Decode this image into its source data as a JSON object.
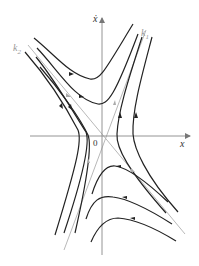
{
  "diagram": {
    "type": "phase-portrait-saddle",
    "axes": {
      "horizontal_label": "x",
      "vertical_label": "ẋ",
      "origin_label": "0"
    },
    "asymptotes": [
      {
        "name": "k1",
        "label_main": "k",
        "label_sub": "1",
        "direction": "up-right"
      },
      {
        "name": "k2",
        "label_main": "k",
        "label_sub": "2",
        "direction": "up-left"
      }
    ],
    "colors": {
      "trajectory": "#222222",
      "asymptote": "#aaaaaa",
      "axis": "#888888",
      "label": "#333333",
      "asymptote_label": "#999999"
    }
  }
}
